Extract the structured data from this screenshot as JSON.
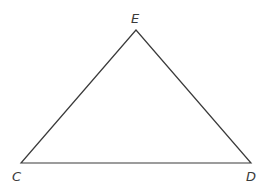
{
  "diagram": {
    "type": "triangle",
    "stroke_color": "#3a3a3a",
    "background": "#ffffff",
    "vertices": [
      {
        "name": "E",
        "label": "E",
        "x": 136,
        "y": 30
      },
      {
        "name": "C",
        "label": "C",
        "x": 21,
        "y": 163
      },
      {
        "name": "D",
        "label": "D",
        "x": 251,
        "y": 163
      }
    ],
    "sides": [
      "CE",
      "ED",
      "CD"
    ]
  }
}
